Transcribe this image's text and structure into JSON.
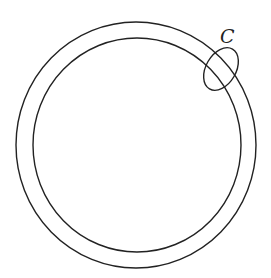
{
  "diagram": {
    "title": "",
    "background": "#ffffff",
    "stroke_color": "#222222",
    "shapes": {
      "outer_circle": {
        "cx": 136,
        "cy": 145,
        "rx": 120,
        "ry": 123
      },
      "inner_circle": {
        "cx": 137,
        "cy": 145,
        "rx": 104,
        "ry": 107
      },
      "loop_c": {
        "cx": 221,
        "cy": 69,
        "rx": 15,
        "ry": 23,
        "rotation": 30
      }
    },
    "labels": {
      "loop_label": "C"
    }
  }
}
